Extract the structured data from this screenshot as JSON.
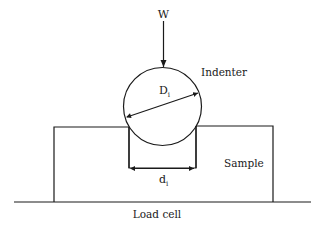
{
  "diagram": {
    "labels": {
      "load": "W",
      "indenter": "Indenter",
      "indenter_diameter": "D",
      "indenter_diameter_sub": "i",
      "sample": "Sample",
      "indent_diameter": "d",
      "indent_diameter_sub": "i",
      "load_cell": "Load cell"
    },
    "colors": {
      "line": "#1a1a1a",
      "background": "#ffffff"
    }
  }
}
